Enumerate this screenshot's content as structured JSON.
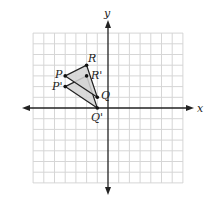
{
  "diagram": {
    "type": "coordinate-plane-translation",
    "axes": {
      "x_label": "x",
      "y_label": "y",
      "range": [
        -7,
        7
      ],
      "grid": true
    },
    "colors": {
      "grid": "#d6d6d6",
      "axis": "#222222",
      "triangle_fill": "#d4d4d4",
      "edge": "#222222"
    },
    "triangles": [
      {
        "name": "original",
        "vertices": [
          {
            "label": "P",
            "x": -4,
            "y": 3
          },
          {
            "label": "Q",
            "x": -1,
            "y": 1
          },
          {
            "label": "R",
            "x": -2,
            "y": 4
          }
        ]
      },
      {
        "name": "image",
        "vertices": [
          {
            "label": "P'",
            "x": -4,
            "y": 2
          },
          {
            "label": "Q'",
            "x": -1,
            "y": 0
          },
          {
            "label": "R'",
            "x": -2,
            "y": 3
          }
        ]
      }
    ],
    "labels": {
      "P": "P",
      "Q": "Q",
      "R": "R",
      "P_prime": "P'",
      "Q_prime": "Q'",
      "R_prime": "R'"
    }
  }
}
